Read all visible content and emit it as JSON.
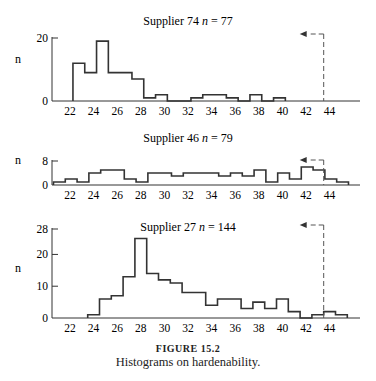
{
  "chart_data": [
    {
      "type": "bar",
      "subtype": "histogram",
      "title": "Supplier  74  n = 77",
      "title_parts": {
        "prefix": "Supplier  74  ",
        "n_var": "n",
        "n_value": " = 77"
      },
      "ylabel": "n",
      "xlabel": "",
      "xticks": [
        22,
        24,
        26,
        28,
        30,
        32,
        34,
        36,
        38,
        40,
        42,
        44
      ],
      "yticks": [
        0,
        20
      ],
      "xlim": [
        20.5,
        46.8
      ],
      "ylim": [
        0,
        20
      ],
      "bin_start": 22.25,
      "bin_width": 1,
      "counts": [
        12,
        9,
        19,
        9,
        9,
        7,
        1,
        2,
        0,
        0,
        1,
        2,
        2,
        1,
        0,
        2,
        0,
        1
      ],
      "spec_limit": 43.5,
      "spec_arrow": "left"
    },
    {
      "type": "bar",
      "subtype": "histogram",
      "title": "Supplier  46  n = 79",
      "title_parts": {
        "prefix": "Supplier  46  ",
        "n_var": "n",
        "n_value": " = 79"
      },
      "ylabel": "n",
      "xlabel": "",
      "xticks": [
        22,
        24,
        26,
        28,
        30,
        32,
        34,
        36,
        38,
        40,
        42,
        44
      ],
      "yticks": [
        0,
        8
      ],
      "xlim": [
        20.5,
        46.8
      ],
      "ylim": [
        0,
        8
      ],
      "bin_start": 20.6,
      "bin_width": 1,
      "counts": [
        1,
        2,
        1,
        4,
        5,
        5,
        2,
        1,
        4,
        4,
        3,
        4,
        4,
        4,
        3,
        4,
        3,
        5,
        1,
        4,
        2,
        6,
        5,
        2,
        1
      ],
      "spec_limit": 43.5,
      "spec_arrow": "left"
    },
    {
      "type": "bar",
      "subtype": "histogram",
      "title": "Supplier  27  n = 144",
      "title_parts": {
        "prefix": "Supplier  27  ",
        "n_var": "n",
        "n_value": " = 144"
      },
      "ylabel": "n",
      "xlabel": "",
      "xticks": [
        22,
        24,
        26,
        28,
        30,
        32,
        34,
        36,
        38,
        40,
        42,
        44
      ],
      "yticks": [
        0,
        10,
        20,
        28
      ],
      "xlim": [
        20.5,
        46.8
      ],
      "ylim": [
        0,
        28
      ],
      "bin_start": 23.5,
      "bin_width": 1,
      "counts": [
        1,
        6,
        7,
        13,
        25,
        14,
        12,
        11,
        8,
        8,
        4,
        6,
        6,
        3,
        5,
        3,
        6,
        2,
        0,
        1,
        2,
        1
      ],
      "spec_limit": 43.5,
      "spec_arrow": "left"
    }
  ],
  "caption": {
    "label": "FIGURE 15.2",
    "text": "Histograms on hardenability."
  }
}
